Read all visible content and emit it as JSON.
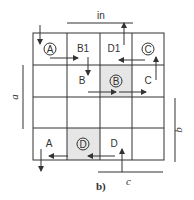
{
  "diagram": {
    "figure_label": "b)",
    "top_label": "in",
    "dimension_labels": {
      "a": "a",
      "b": "b",
      "c": "c"
    },
    "grid": {
      "rows": 4,
      "cols": 4,
      "shaded_cells": [
        [
          1,
          2
        ],
        [
          3,
          1
        ]
      ]
    },
    "cells": {
      "r0c0_circled": "A",
      "r0c1": "B1",
      "r0c2": "D1",
      "r0c3_circled": "C",
      "r1c1": "B",
      "r1c2_circled": "B",
      "r1c3": "C",
      "r3c0": "A",
      "r3c1_circled": "D",
      "r3c2": "D"
    },
    "colors": {
      "line": "#333333",
      "shade": "#e6e6e6"
    }
  }
}
